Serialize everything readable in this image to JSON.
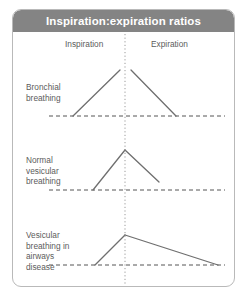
{
  "figure": {
    "title": "Inspiration:expiration ratios",
    "header_color": "#848484",
    "title_color": "#ffffff",
    "border_color": "#b9b9b9",
    "background": "#ffffff"
  },
  "axes": {
    "phase_labels": [
      "Inspiration",
      "Expiration"
    ],
    "divider": {
      "style": "dotted",
      "orientation": "vertical",
      "color": "#9a9a9a",
      "x": 112
    },
    "baseline": {
      "style": "dashed",
      "color": "#555555"
    },
    "trace_color": "#6f6f6f"
  },
  "rows": [
    {
      "label": "Bronchial breathing",
      "label_lines": [
        "Bronchial",
        "breathing"
      ],
      "ratio_description": "inspiration and expiration equal with a gap between them"
    },
    {
      "label": "Normal vesicular breathing",
      "label_lines": [
        "Normal",
        "vesicular",
        "breathing"
      ],
      "ratio_description": "long inspiration, short expiration, continuous peak"
    },
    {
      "label": "Vesicular breathing in airways disease",
      "label_lines": [
        "Vesicular",
        "breathing in",
        "airways",
        "disease"
      ],
      "ratio_description": "short inspiration, prolonged expiration"
    }
  ],
  "chart_data": {
    "type": "line",
    "title": "Inspiration:expiration ratios",
    "xlabel": "",
    "ylabel": "",
    "grid": false,
    "legend_position": "none",
    "center_divider_x": 112,
    "xlim": [
      0,
      223
    ],
    "annotations": [
      "Inspiration",
      "Expiration"
    ],
    "series": [
      {
        "name": "Bronchial breathing",
        "baseline_y": 84,
        "baseline_x_range": [
          36,
          212
        ],
        "segments": [
          {
            "phase": "inspiration",
            "points": [
              [
                60,
                84
              ],
              [
                107,
                38
              ]
            ]
          },
          {
            "phase": "expiration",
            "points": [
              [
                118,
                38
              ],
              [
                163,
                84
              ]
            ]
          }
        ]
      },
      {
        "name": "Normal vesicular breathing",
        "baseline_y": 158,
        "baseline_x_range": [
          36,
          212
        ],
        "segments": [
          {
            "phase": "inspiration",
            "points": [
              [
                80,
                158
              ],
              [
                112,
                118
              ]
            ]
          },
          {
            "phase": "expiration",
            "points": [
              [
                112,
                118
              ],
              [
                146,
                150
              ]
            ]
          }
        ]
      },
      {
        "name": "Vesicular breathing in airways disease",
        "baseline_y": 233,
        "baseline_x_range": [
          36,
          212
        ],
        "segments": [
          {
            "phase": "inspiration",
            "points": [
              [
                82,
                233
              ],
              [
                112,
                203
              ]
            ]
          },
          {
            "phase": "expiration",
            "points": [
              [
                112,
                203
              ],
              [
                205,
                233
              ]
            ]
          }
        ]
      }
    ]
  }
}
